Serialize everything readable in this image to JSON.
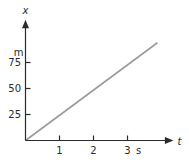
{
  "chart_data": {
    "type": "line",
    "title": "",
    "xlabel": "t",
    "ylabel": "x",
    "x_unit": "s",
    "y_unit": "m",
    "x_ticks": [
      1,
      2,
      3
    ],
    "y_ticks": [
      25,
      50,
      75
    ],
    "xlim": [
      0,
      4.35
    ],
    "ylim": [
      0,
      116
    ],
    "grid": false,
    "legend": false,
    "series": [
      {
        "name": "position-vs-time",
        "color": "#9b9b9b",
        "points": [
          [
            0,
            0
          ],
          [
            3.88,
            94
          ]
        ]
      }
    ],
    "axis_color": "#2b2b2b",
    "background": "#ffffff"
  }
}
